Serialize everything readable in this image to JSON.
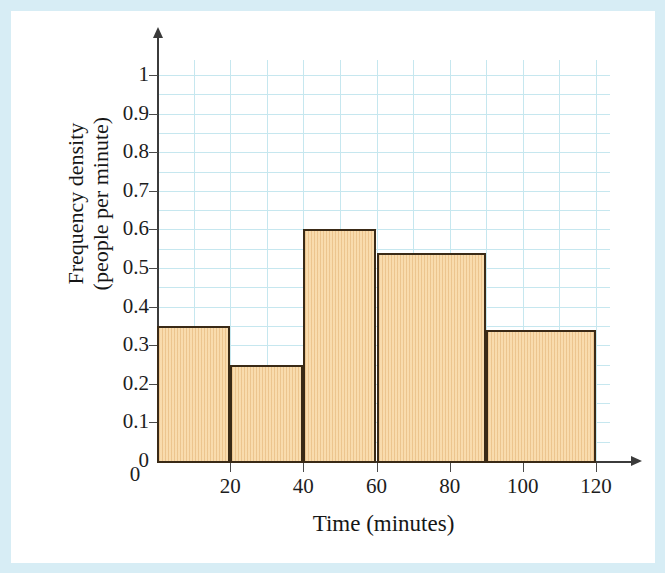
{
  "page": {
    "frame_color": "#d7edf5",
    "background_color": "#ffffff"
  },
  "chart_data": {
    "type": "bar",
    "title": "",
    "subtitle": "",
    "xlabel": "Time (minutes)",
    "ylabel_line1": "Frequency density",
    "ylabel_line2": "(people per minute)",
    "xlim": [
      0,
      120
    ],
    "ylim": [
      0,
      1.05
    ],
    "grid": true,
    "legend": "none",
    "x_tick_labels": [
      "0",
      "20",
      "40",
      "60",
      "80",
      "100",
      "120"
    ],
    "x_tick_values": [
      0,
      20,
      40,
      60,
      80,
      100,
      120
    ],
    "y_tick_labels": [
      "0",
      "0.1",
      "0.2",
      "0.3",
      "0.4",
      "0.5",
      "0.6",
      "0.7",
      "0.8",
      "0.9",
      "1"
    ],
    "y_tick_values": [
      0,
      0.1,
      0.2,
      0.3,
      0.4,
      0.5,
      0.6,
      0.7,
      0.8,
      0.9,
      1
    ],
    "bar_fill_color": "#f6d6a4",
    "bar_edge_color": "#3a2a16",
    "gridline_color": "#c6e7ef",
    "axis_color": "#3b3b3b",
    "categories": [
      "0-20",
      "20-40",
      "40-60",
      "60-90",
      "90-120"
    ],
    "bins": [
      {
        "label": "0-20",
        "x_start": 0,
        "x_end": 20,
        "value": 0.35,
        "frequency": 7
      },
      {
        "label": "20-40",
        "x_start": 20,
        "x_end": 40,
        "value": 0.25,
        "frequency": 5
      },
      {
        "label": "40-60",
        "x_start": 40,
        "x_end": 60,
        "value": 0.6,
        "frequency": 12
      },
      {
        "label": "60-90",
        "x_start": 60,
        "x_end": 90,
        "value": 0.54,
        "frequency": 16
      },
      {
        "label": "90-120",
        "x_start": 90,
        "x_end": 120,
        "value": 0.34,
        "frequency": 10
      }
    ],
    "values": [
      0.35,
      0.25,
      0.6,
      0.54,
      0.34
    ]
  }
}
